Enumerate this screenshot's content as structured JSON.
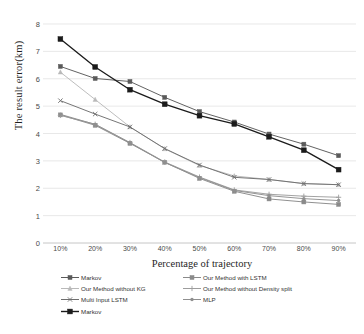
{
  "chart_data": {
    "type": "line",
    "title": "",
    "xlabel": "Percentage of trajectory",
    "ylabel": "The result error(km)",
    "categories": [
      "10%",
      "20%",
      "30%",
      "40%",
      "50%",
      "60%",
      "70%",
      "80%",
      "90%"
    ],
    "ylim": [
      0,
      8
    ],
    "yticks": [
      0,
      1,
      2,
      3,
      4,
      5,
      6,
      7,
      8
    ],
    "grid": true,
    "legend_position": "bottom",
    "series": [
      {
        "name": "Markov",
        "marker": "square",
        "color": "#5a5a5a",
        "values": [
          6.45,
          6.01,
          5.9,
          5.32,
          4.8,
          4.42,
          3.98,
          3.61,
          3.19
        ]
      },
      {
        "name": "Our Method with LSTM",
        "marker": "square",
        "color": "#8a8a8a",
        "values": [
          4.68,
          4.3,
          3.64,
          2.95,
          2.36,
          1.89,
          1.61,
          1.5,
          1.41
        ]
      },
      {
        "name": "Our Method without KG",
        "marker": "triangle",
        "color": "#b9b9b9",
        "values": [
          6.24,
          5.24,
          4.24,
          3.44,
          2.83,
          2.45,
          2.32,
          2.17,
          2.13
        ]
      },
      {
        "name": "Our Method without Density split",
        "marker": "plus",
        "color": "#9d9d9d",
        "values": [
          4.66,
          4.34,
          3.67,
          2.96,
          2.41,
          1.94,
          1.78,
          1.71,
          1.67
        ]
      },
      {
        "name": "Multi Input LSTM",
        "marker": "cross",
        "color": "#6f6f6f",
        "values": [
          5.2,
          4.71,
          4.24,
          3.45,
          2.85,
          2.4,
          2.32,
          2.17,
          2.13
        ]
      },
      {
        "name": "MLP",
        "marker": "dot",
        "color": "#8f8f8f",
        "values": [
          4.7,
          4.33,
          3.66,
          2.94,
          2.39,
          1.92,
          1.73,
          1.62,
          1.55
        ]
      },
      {
        "name": "Markov",
        "marker": "square-filled",
        "color": "#1b1b1b",
        "values": [
          7.45,
          6.43,
          5.6,
          5.07,
          4.65,
          4.35,
          3.88,
          3.39,
          2.68
        ]
      }
    ]
  },
  "legend": {
    "rows": [
      [
        {
          "label": "Markov",
          "marker": "square",
          "color": "#5a5a5a"
        },
        {
          "label": "Our Method with LSTM",
          "marker": "square",
          "color": "#8a8a8a"
        }
      ],
      [
        {
          "label": "Our Method without KG",
          "marker": "triangle",
          "color": "#b9b9b9"
        },
        {
          "label": "Our Method without Density split",
          "marker": "plus",
          "color": "#9d9d9d"
        }
      ],
      [
        {
          "label": "Multi Input LSTM",
          "marker": "cross",
          "color": "#6f6f6f"
        },
        {
          "label": "MLP",
          "marker": "dot",
          "color": "#8f8f8f"
        }
      ],
      [
        {
          "label": "Markov",
          "marker": "square-filled",
          "color": "#1b1b1b"
        }
      ]
    ]
  },
  "axes": {
    "gridline_color": "#dedede"
  }
}
